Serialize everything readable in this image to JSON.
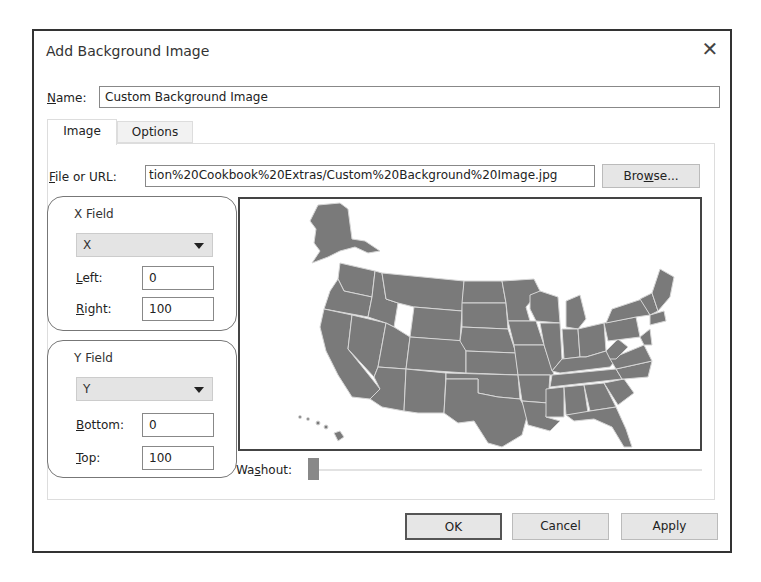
{
  "dialog": {
    "title": "Add Background Image",
    "close_icon": "close-icon"
  },
  "name": {
    "label_accel": "N",
    "label_rest": "ame:",
    "value": "Custom Background Image"
  },
  "tabs": [
    {
      "label": "Image",
      "active": true
    },
    {
      "label": "Options",
      "active": false
    }
  ],
  "file": {
    "label_accel": "F",
    "label_rest": "ile or URL:",
    "value": "tion%20Cookbook%20Extras/Custom%20Background%20Image.jpg",
    "browse_pre": "Bro",
    "browse_accel": "w",
    "browse_post": "se..."
  },
  "x_field": {
    "title": "X Field",
    "selected": "X",
    "left_accel": "L",
    "left_rest": "eft:",
    "left_value": "0",
    "right_accel": "R",
    "right_rest": "ight:",
    "right_value": "100"
  },
  "y_field": {
    "title": "Y Field",
    "selected": "Y",
    "bottom_accel": "B",
    "bottom_rest": "ottom:",
    "bottom_value": "0",
    "top_accel": "T",
    "top_rest": "op:",
    "top_value": "100"
  },
  "preview": {
    "description": "US states map preview",
    "fill_color": "#7a7a7a",
    "border_color": "#d8d8d8"
  },
  "washout": {
    "label_pre": "Wa",
    "label_accel": "s",
    "label_post": "hout:",
    "value": 0
  },
  "buttons": {
    "ok": "OK",
    "cancel": "Cancel",
    "apply": "Apply"
  }
}
